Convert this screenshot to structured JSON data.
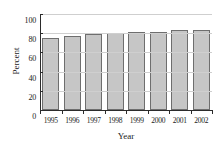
{
  "chart_data": {
    "type": "bar",
    "title": "",
    "xlabel": "Year",
    "ylabel": "Percent",
    "categories": [
      "1995",
      "1996",
      "1997",
      "1998",
      "1999",
      "2000",
      "2001",
      "2002"
    ],
    "values": [
      75,
      77,
      79,
      80,
      81.5,
      81.5,
      83,
      83
    ],
    "ylim": [
      0,
      100
    ],
    "yticks": [
      0,
      20,
      40,
      60,
      80,
      100
    ],
    "ytick_labels": [
      "0",
      "20",
      "40",
      "60",
      "80",
      "100"
    ],
    "grid": "horizontal-light",
    "legend": "none",
    "bar_fill": "#c6c6c6",
    "bar_border": "#6e6e6e",
    "axis_color": "#2b2b2b",
    "grid_color": "#cfcfcf"
  }
}
